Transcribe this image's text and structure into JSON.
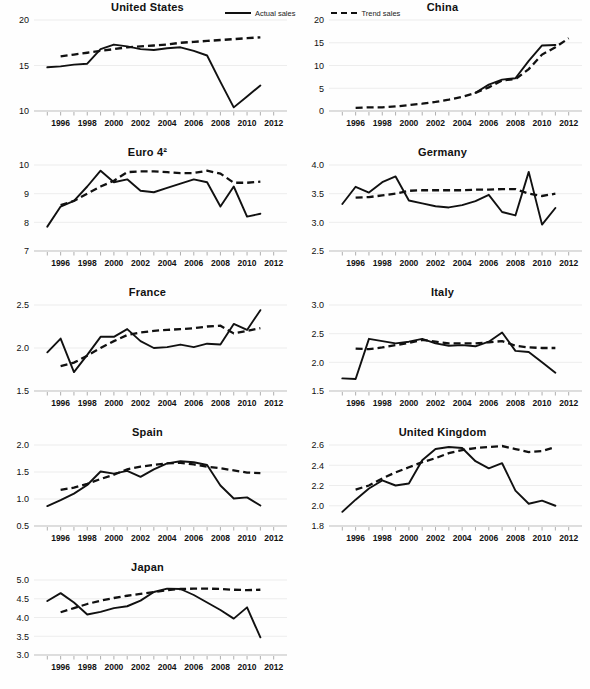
{
  "legend": {
    "actual_label": "Actual sales",
    "trend_label": "Trend sales",
    "actual_style": "solid",
    "trend_style": "dashed",
    "line_color": "#111111"
  },
  "axis": {
    "x_tick_labels": [
      "1996",
      "1998",
      "2000",
      "2002",
      "2004",
      "2006",
      "2008",
      "2010",
      "2012"
    ],
    "x_min": 1994,
    "x_max": 2013,
    "x_minor_step": 1
  },
  "chart_data": [
    {
      "type": "line",
      "title": "United States",
      "xlabel": "",
      "ylabel": "",
      "grid": true,
      "legend_position": "top-center",
      "ylim": [
        10,
        20
      ],
      "yticks": [
        10,
        15,
        20
      ],
      "ytick_labels": [
        "10",
        "15",
        "20"
      ],
      "x": [
        1995,
        1996,
        1997,
        1998,
        1999,
        2000,
        2001,
        2002,
        2003,
        2004,
        2005,
        2006,
        2007,
        2008,
        2009,
        2010,
        2011
      ],
      "series": [
        {
          "name": "Actual sales",
          "style": "solid",
          "values": [
            14.8,
            14.9,
            15.1,
            15.2,
            16.8,
            17.3,
            17.1,
            16.8,
            16.7,
            16.9,
            17.0,
            16.6,
            16.1,
            13.2,
            10.4,
            11.6,
            12.8
          ]
        },
        {
          "name": "Trend sales",
          "style": "dashed",
          "values": [
            null,
            16.0,
            16.2,
            16.4,
            16.6,
            16.8,
            17.0,
            17.1,
            17.2,
            17.3,
            17.5,
            17.6,
            17.7,
            17.8,
            17.9,
            18.0,
            18.1
          ]
        }
      ]
    },
    {
      "type": "line",
      "title": "China",
      "xlabel": "",
      "ylabel": "",
      "grid": true,
      "legend_position": "none",
      "ylim": [
        0,
        20
      ],
      "yticks": [
        0,
        5,
        10,
        15,
        20
      ],
      "ytick_labels": [
        "0",
        "5",
        "10",
        "15",
        "20"
      ],
      "x": [
        1995,
        1996,
        1997,
        1998,
        1999,
        2000,
        2001,
        2002,
        2003,
        2004,
        2005,
        2006,
        2007,
        2008,
        2009,
        2010,
        2011
      ],
      "series": [
        {
          "name": "Actual sales",
          "style": "solid",
          "values": [
            null,
            null,
            null,
            null,
            null,
            null,
            null,
            null,
            null,
            null,
            4.0,
            5.8,
            6.9,
            7.2,
            11.0,
            14.4,
            14.5
          ]
        },
        {
          "name": "Trend sales",
          "style": "dashed",
          "values": [
            null,
            0.7,
            0.8,
            0.8,
            1.0,
            1.3,
            1.6,
            2.0,
            2.5,
            3.1,
            4.0,
            5.2,
            6.7,
            7.0,
            9.2,
            12.4,
            14.0,
            16.0
          ]
        }
      ]
    },
    {
      "type": "line",
      "title": "Euro 4²",
      "xlabel": "",
      "ylabel": "",
      "grid": true,
      "legend_position": "none",
      "ylim": [
        7,
        10
      ],
      "yticks": [
        7,
        8,
        9,
        10
      ],
      "ytick_labels": [
        "7",
        "8",
        "9",
        "10"
      ],
      "x": [
        1995,
        1996,
        1997,
        1998,
        1999,
        2000,
        2001,
        2002,
        2003,
        2004,
        2005,
        2006,
        2007,
        2008,
        2009,
        2010,
        2011
      ],
      "series": [
        {
          "name": "Actual sales",
          "style": "solid",
          "values": [
            7.85,
            8.55,
            8.75,
            9.25,
            9.8,
            9.4,
            9.5,
            9.1,
            9.05,
            9.2,
            9.35,
            9.5,
            9.4,
            8.55,
            9.25,
            8.2,
            8.3
          ]
        },
        {
          "name": "Trend sales",
          "style": "dashed",
          "values": [
            null,
            8.6,
            8.75,
            9.0,
            9.25,
            9.45,
            9.75,
            9.78,
            9.78,
            9.75,
            9.72,
            9.72,
            9.8,
            9.7,
            9.38,
            9.38,
            9.42
          ]
        }
      ]
    },
    {
      "type": "line",
      "title": "Germany",
      "xlabel": "",
      "ylabel": "",
      "grid": true,
      "legend_position": "none",
      "ylim": [
        2.5,
        4.0
      ],
      "yticks": [
        2.5,
        3.0,
        3.5,
        4.0
      ],
      "ytick_labels": [
        "2.5",
        "3.0",
        "3.5",
        "4.0"
      ],
      "x": [
        1995,
        1996,
        1997,
        1998,
        1999,
        2000,
        2001,
        2002,
        2003,
        2004,
        2005,
        2006,
        2007,
        2008,
        2009,
        2010,
        2011
      ],
      "series": [
        {
          "name": "Actual sales",
          "style": "solid",
          "values": [
            3.32,
            3.62,
            3.52,
            3.7,
            3.8,
            3.38,
            3.33,
            3.28,
            3.26,
            3.3,
            3.37,
            3.48,
            3.18,
            3.12,
            3.88,
            2.96,
            3.25
          ]
        },
        {
          "name": "Trend sales",
          "style": "dashed",
          "values": [
            null,
            3.43,
            3.44,
            3.47,
            3.5,
            3.55,
            3.56,
            3.56,
            3.56,
            3.56,
            3.57,
            3.57,
            3.58,
            3.58,
            3.5,
            3.46,
            3.5
          ]
        }
      ]
    },
    {
      "type": "line",
      "title": "France",
      "xlabel": "",
      "ylabel": "",
      "grid": true,
      "legend_position": "none",
      "ylim": [
        1.5,
        2.5
      ],
      "yticks": [
        1.5,
        2.0,
        2.5
      ],
      "ytick_labels": [
        "1.5",
        "2.0",
        "2.5"
      ],
      "x": [
        1995,
        1996,
        1997,
        1998,
        1999,
        2000,
        2001,
        2002,
        2003,
        2004,
        2005,
        2006,
        2007,
        2008,
        2009,
        2010,
        2011
      ],
      "series": [
        {
          "name": "Actual sales",
          "style": "solid",
          "values": [
            1.95,
            2.11,
            1.72,
            1.92,
            2.13,
            2.13,
            2.22,
            2.08,
            2.0,
            2.01,
            2.04,
            2.01,
            2.05,
            2.04,
            2.28,
            2.21,
            2.44
          ]
        },
        {
          "name": "Trend sales",
          "style": "dashed",
          "values": [
            null,
            1.79,
            1.83,
            1.91,
            2.0,
            2.08,
            2.15,
            2.18,
            2.2,
            2.21,
            2.22,
            2.23,
            2.25,
            2.26,
            2.17,
            2.2,
            2.23
          ]
        }
      ]
    },
    {
      "type": "line",
      "title": "Italy",
      "xlabel": "",
      "ylabel": "",
      "grid": true,
      "legend_position": "none",
      "ylim": [
        1.5,
        3.0
      ],
      "yticks": [
        1.5,
        2.0,
        2.5,
        3.0
      ],
      "ytick_labels": [
        "1.5",
        "2.0",
        "2.5",
        "3.0"
      ],
      "x": [
        1995,
        1996,
        1997,
        1998,
        1999,
        2000,
        2001,
        2002,
        2003,
        2004,
        2005,
        2006,
        2007,
        2008,
        2009,
        2010,
        2011
      ],
      "series": [
        {
          "name": "Actual sales",
          "style": "solid",
          "values": [
            1.72,
            1.71,
            2.41,
            2.37,
            2.33,
            2.36,
            2.41,
            2.33,
            2.29,
            2.3,
            2.28,
            2.36,
            2.52,
            2.2,
            2.18,
            2.0,
            1.82
          ]
        },
        {
          "name": "Trend sales",
          "style": "dashed",
          "values": [
            null,
            2.24,
            2.23,
            2.26,
            2.3,
            2.34,
            2.39,
            2.36,
            2.33,
            2.33,
            2.33,
            2.35,
            2.37,
            2.29,
            2.26,
            2.25,
            2.25
          ]
        }
      ]
    },
    {
      "type": "line",
      "title": "Spain",
      "xlabel": "",
      "ylabel": "",
      "grid": true,
      "legend_position": "none",
      "ylim": [
        0.5,
        2.0
      ],
      "yticks": [
        0.5,
        1.0,
        1.5,
        2.0
      ],
      "ytick_labels": [
        "0.5",
        "1.0",
        "1.5",
        "2.0"
      ],
      "x": [
        1995,
        1996,
        1997,
        1998,
        1999,
        2000,
        2001,
        2002,
        2003,
        2004,
        2005,
        2006,
        2007,
        2008,
        2009,
        2010,
        2011
      ],
      "series": [
        {
          "name": "Actual sales",
          "style": "solid",
          "values": [
            0.87,
            0.98,
            1.1,
            1.26,
            1.51,
            1.47,
            1.52,
            1.41,
            1.55,
            1.66,
            1.7,
            1.68,
            1.63,
            1.25,
            1.01,
            1.03,
            0.88
          ]
        },
        {
          "name": "Trend sales",
          "style": "dashed",
          "values": [
            null,
            1.17,
            1.21,
            1.28,
            1.37,
            1.45,
            1.55,
            1.6,
            1.63,
            1.66,
            1.67,
            1.64,
            1.6,
            1.57,
            1.53,
            1.49,
            1.48
          ]
        }
      ]
    },
    {
      "type": "line",
      "title": "United Kingdom",
      "xlabel": "",
      "ylabel": "",
      "grid": true,
      "legend_position": "none",
      "ylim": [
        1.8,
        2.6
      ],
      "yticks": [
        1.8,
        2.0,
        2.2,
        2.4,
        2.6
      ],
      "ytick_labels": [
        "1.8",
        "2.0",
        "2.2",
        "2.4",
        "2.6"
      ],
      "x": [
        1995,
        1996,
        1997,
        1998,
        1999,
        2000,
        2001,
        2002,
        2003,
        2004,
        2005,
        2006,
        2007,
        2008,
        2009,
        2010,
        2011
      ],
      "series": [
        {
          "name": "Actual sales",
          "style": "solid",
          "values": [
            1.94,
            2.06,
            2.17,
            2.25,
            2.2,
            2.22,
            2.45,
            2.56,
            2.58,
            2.57,
            2.44,
            2.37,
            2.42,
            2.15,
            2.02,
            2.05,
            2.0
          ]
        },
        {
          "name": "Trend sales",
          "style": "dashed",
          "values": [
            null,
            2.16,
            2.2,
            2.27,
            2.33,
            2.38,
            2.43,
            2.47,
            2.52,
            2.55,
            2.57,
            2.58,
            2.59,
            2.56,
            2.53,
            2.54,
            2.58
          ]
        }
      ]
    },
    {
      "type": "line",
      "title": "Japan",
      "xlabel": "",
      "ylabel": "",
      "grid": true,
      "legend_position": "none",
      "ylim": [
        3.0,
        5.0
      ],
      "yticks": [
        3.0,
        3.5,
        4.0,
        4.5,
        5.0
      ],
      "ytick_labels": [
        "3.0",
        "3.5",
        "4.0",
        "4.5",
        "5.0"
      ],
      "x": [
        1995,
        1996,
        1997,
        1998,
        1999,
        2000,
        2001,
        2002,
        2003,
        2004,
        2005,
        2006,
        2007,
        2008,
        2009,
        2010,
        2011
      ],
      "series": [
        {
          "name": "Actual sales",
          "style": "solid",
          "values": [
            4.44,
            4.65,
            4.4,
            4.08,
            4.15,
            4.25,
            4.3,
            4.45,
            4.68,
            4.77,
            4.76,
            4.6,
            4.4,
            4.2,
            3.97,
            4.27,
            3.47
          ]
        },
        {
          "name": "Trend sales",
          "style": "dashed",
          "values": [
            null,
            4.14,
            4.25,
            4.36,
            4.45,
            4.52,
            4.58,
            4.63,
            4.68,
            4.73,
            4.76,
            4.77,
            4.77,
            4.76,
            4.74,
            4.73,
            4.74
          ]
        }
      ]
    }
  ]
}
